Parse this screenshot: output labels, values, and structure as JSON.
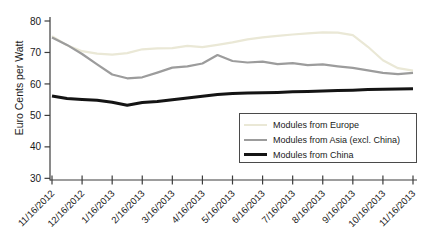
{
  "chart_data": {
    "type": "line",
    "title": "",
    "xlabel": "",
    "ylabel": "Euro Cents per Watt",
    "ylim": [
      30,
      80
    ],
    "yticks": [
      30,
      40,
      50,
      60,
      70,
      80
    ],
    "grid": false,
    "legend_position": "lower right",
    "x_unit": "months since first date, semi-monthly samples",
    "x_tick_labels": [
      "11/16/2012",
      "12/16/2012",
      "1/16/2013",
      "2/16/2013",
      "3/16/2013",
      "4/16/2013",
      "5/16/2013",
      "6/16/2013",
      "7/16/2013",
      "8/16/2013",
      "9/16/2013",
      "10/16/2013",
      "11/16/2013"
    ],
    "x": [
      0,
      0.5,
      1,
      1.5,
      2,
      2.5,
      3,
      3.5,
      4,
      4.5,
      5,
      5.5,
      6,
      6.5,
      7,
      7.5,
      8,
      8.5,
      9,
      9.5,
      10,
      10.5,
      11,
      11.5,
      12
    ],
    "series": [
      {
        "name": "Modules from Europe",
        "color": "#eae8d6",
        "stroke_width": 2.2,
        "values": [
          75.2,
          72.3,
          70.4,
          69.6,
          69.3,
          69.8,
          71.0,
          71.3,
          71.4,
          72.1,
          71.7,
          72.4,
          73.2,
          74.2,
          74.8,
          75.3,
          75.7,
          76.1,
          76.4,
          76.3,
          75.5,
          71.8,
          67.5,
          65.0,
          64.2
        ]
      },
      {
        "name": "Modules from Asia (excl. China)",
        "color": "#9c9c9c",
        "stroke_width": 2.2,
        "values": [
          74.8,
          72.4,
          69.5,
          66.2,
          63.0,
          61.8,
          62.1,
          63.6,
          65.2,
          65.6,
          66.5,
          69.2,
          67.3,
          66.8,
          67.1,
          66.3,
          66.6,
          66.0,
          66.2,
          65.6,
          65.1,
          64.3,
          63.5,
          63.1,
          63.5
        ]
      },
      {
        "name": "Modules from China",
        "color": "#141414",
        "stroke_width": 3,
        "values": [
          56.2,
          55.4,
          55.1,
          54.8,
          54.2,
          53.2,
          54.1,
          54.4,
          55.0,
          55.5,
          56.1,
          56.6,
          57.0,
          57.1,
          57.2,
          57.3,
          57.5,
          57.6,
          57.8,
          57.9,
          58.0,
          58.2,
          58.3,
          58.4,
          58.5
        ]
      }
    ]
  }
}
